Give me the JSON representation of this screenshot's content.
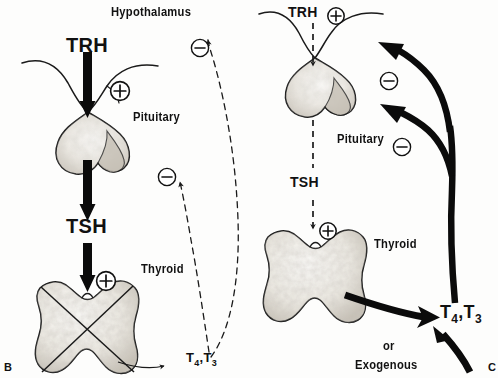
{
  "figure": {
    "panels": [
      {
        "id": "B",
        "letter": "B",
        "condition": "primary hypothyroidism",
        "labels": {
          "hypothalamus": "Hypothalamus",
          "trh": "TRH",
          "pituitary": "Pituitary",
          "tsh": "TSH",
          "thyroid": "Thyroid",
          "hormones": "T₄,T₃",
          "hormones_base": "T",
          "hormones_sub1": "4",
          "hormones_sep": ",T",
          "hormones_sub2": "3"
        },
        "signs": {
          "pituitary_stimulation": "⊕",
          "thyroid_stimulation": "⊕",
          "feedback_hypothalamus": "⊖",
          "feedback_pituitary": "⊖"
        },
        "arrow_styles": {
          "trh": "thick-solid",
          "tsh": "thick-solid",
          "feedback_hypothalamus": "thin-dashed",
          "feedback_pituitary": "thin-dashed",
          "thyroid_output": "thin-dashed"
        },
        "thyroid_crossed_out": true
      },
      {
        "id": "C",
        "letter": "C",
        "condition": "exogenous thyroid hormone excess",
        "labels": {
          "trh": "TRH",
          "pituitary": "Pituitary",
          "tsh": "TSH",
          "thyroid": "Thyroid",
          "hormones": "T₄,T₃",
          "hormones_base": "T",
          "hormones_sub1": "4",
          "hormones_sep": ",T",
          "hormones_sub2": "3",
          "or": "or",
          "exogenous": "Exogenous"
        },
        "signs": {
          "pituitary_stimulation": "⊕",
          "thyroid_stimulation": "⊕",
          "feedback_hypothalamus": "⊖",
          "feedback_pituitary": "⊖"
        },
        "arrow_styles": {
          "trh": "thin-dashed",
          "tsh": "thin-dashed",
          "feedback_hypothalamus": "thick-solid",
          "feedback_pituitary": "thick-solid",
          "thyroid_output": "thick-solid",
          "exogenous_input": "thick-solid"
        },
        "thyroid_crossed_out": false
      }
    ],
    "colors": {
      "ink": "#111111",
      "outline": "#1a1a1a",
      "gland_fill": "#f4f2ee",
      "gland_shade": "#b9b4ab",
      "background": "#fdfdfc"
    }
  }
}
